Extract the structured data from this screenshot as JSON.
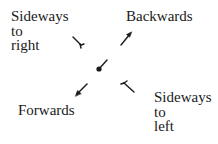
{
  "diagram": {
    "title": "",
    "labels": {
      "sideways_right": [
        "Sideways",
        "to",
        "right"
      ],
      "backwards": "Backwards",
      "forwards": "Forwards",
      "sideways_left": [
        "Sideways",
        "to",
        "left"
      ]
    },
    "nodes": [
      {
        "id": "center",
        "shape": "ball-on-stick",
        "x": 99,
        "y": 69
      },
      {
        "id": "sideways-right-symbol",
        "shape": "tailed-line",
        "direction": "up-left"
      },
      {
        "id": "backwards-arrow",
        "shape": "arrow",
        "direction": "up-right"
      },
      {
        "id": "forwards-arrow",
        "shape": "arrow",
        "direction": "down-left"
      },
      {
        "id": "sideways-left-symbol",
        "shape": "tailed-line",
        "direction": "down-right"
      }
    ],
    "colors": {
      "ink": "#1a1a1a",
      "background": "#ffffff"
    }
  }
}
